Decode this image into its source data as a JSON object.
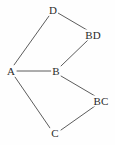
{
  "diagram": {
    "type": "undirected-graph",
    "width": 115,
    "height": 145,
    "background_color": "#fefefe",
    "edge_color": "#4a4a4a",
    "label_color": "#2b2b2b",
    "nodes": [
      {
        "id": "A",
        "label": "A",
        "x": 11,
        "y": 71
      },
      {
        "id": "B",
        "label": "B",
        "x": 56,
        "y": 71
      },
      {
        "id": "C",
        "label": "C",
        "x": 55,
        "y": 133
      },
      {
        "id": "D",
        "label": "D",
        "x": 53,
        "y": 10
      },
      {
        "id": "BD",
        "label": "BD",
        "x": 93,
        "y": 35
      },
      {
        "id": "BC",
        "label": "BC",
        "x": 101,
        "y": 101
      }
    ],
    "edges": [
      {
        "from": "A",
        "to": "D",
        "x1": 14,
        "y1": 65,
        "x2": 49,
        "y2": 16
      },
      {
        "from": "A",
        "to": "B",
        "x1": 17,
        "y1": 71,
        "x2": 51,
        "y2": 71
      },
      {
        "from": "A",
        "to": "C",
        "x1": 15,
        "y1": 77,
        "x2": 50,
        "y2": 128
      },
      {
        "from": "D",
        "to": "BD",
        "x1": 58,
        "y1": 13,
        "x2": 87,
        "y2": 30
      },
      {
        "from": "B",
        "to": "BD",
        "x1": 61,
        "y1": 66,
        "x2": 88,
        "y2": 40
      },
      {
        "from": "B",
        "to": "BC",
        "x1": 61,
        "y1": 76,
        "x2": 95,
        "y2": 96
      },
      {
        "from": "C",
        "to": "BC",
        "x1": 61,
        "y1": 130,
        "x2": 95,
        "y2": 106
      }
    ]
  }
}
